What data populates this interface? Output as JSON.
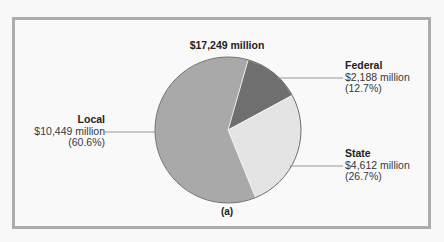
{
  "chart_data": {
    "type": "pie",
    "title": "$17,249 million",
    "caption": "(a)",
    "total": 17249,
    "unit": "million",
    "start_angle_deg": 16,
    "slices": [
      {
        "name": "Federal",
        "value": 2188,
        "value_label": "$2,188 million",
        "percent": 12.7,
        "percent_label": "(12.7%)",
        "color": "#6f6f6f"
      },
      {
        "name": "State",
        "value": 4612,
        "value_label": "$4,612 million",
        "percent": 26.7,
        "percent_label": "(26.7%)",
        "color": "#e4e4e4"
      },
      {
        "name": "Local",
        "value": 10449,
        "value_label": "$10,449 million",
        "percent": 60.6,
        "percent_label": "(60.6%)",
        "color": "#a9a9a9"
      }
    ],
    "legend": "none (direct labels with leader lines)"
  },
  "colors": {
    "background": "#f8f8f8",
    "frame_border": "#acacac",
    "slice_outline": "#5a5a5a",
    "leader_line": "#8a8a8a"
  }
}
